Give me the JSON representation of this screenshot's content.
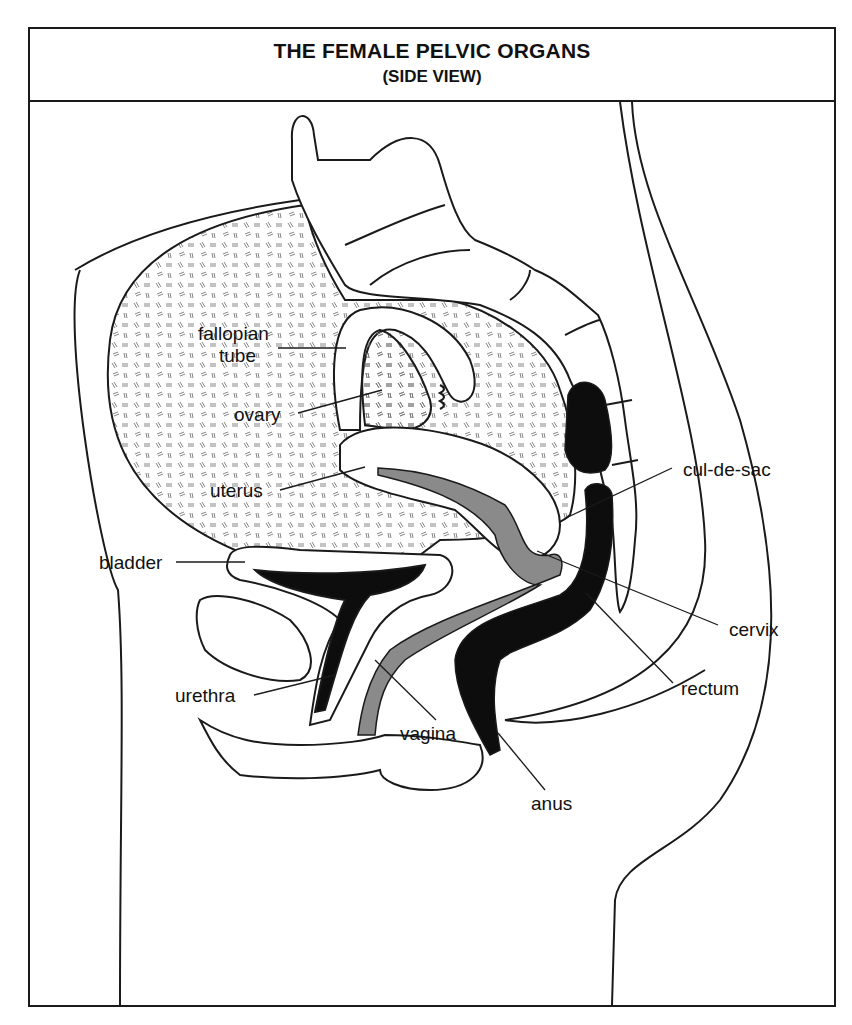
{
  "header": {
    "title": "THE FEMALE PELVIC ORGANS",
    "subtitle": "(SIDE VIEW)"
  },
  "labels": {
    "fallopian_tube_line1": "fallopian",
    "fallopian_tube_line2": "tube",
    "ovary": "ovary",
    "uterus": "uterus",
    "bladder": "bladder",
    "urethra": "urethra",
    "vagina": "vagina",
    "anus": "anus",
    "rectum": "rectum",
    "cervix": "cervix",
    "cul_de_sac": "cul-de-sac"
  },
  "colors": {
    "outline": "#1a1a1a",
    "cavity_dark": "#0d0d0d",
    "vagina_gray": "#8a8a8a",
    "background": "#ffffff"
  }
}
